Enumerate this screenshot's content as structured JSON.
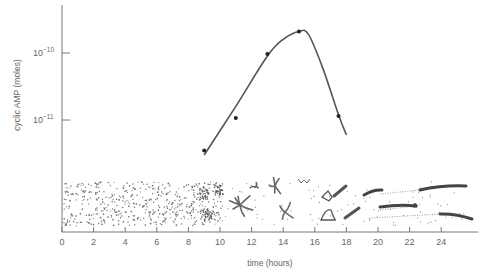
{
  "chart_data": {
    "type": "line",
    "title": "",
    "xlabel": "time (hours)",
    "ylabel": "cyclic AMP (moles)",
    "yscale": "log",
    "x_ticks": [
      0,
      2,
      4,
      6,
      8,
      10,
      12,
      14,
      16,
      18,
      20,
      22,
      24
    ],
    "x_tick_labels": [
      "0",
      "2",
      "4",
      "6",
      "8",
      "10",
      "12",
      "14",
      "16",
      "18",
      "20",
      "22",
      "24"
    ],
    "xlim": [
      0,
      26
    ],
    "y_ticks": [
      1e-10,
      1e-11
    ],
    "y_tick_labels": [
      {
        "base": "10",
        "exp": "−10"
      },
      {
        "base": "10",
        "exp": "−11"
      }
    ],
    "grid": false,
    "legend": null,
    "series": [
      {
        "name": "measured cyclic AMP",
        "marker": "dot",
        "x": [
          9,
          11,
          13,
          15,
          17.5
        ],
        "y": [
          3.5e-12,
          1.07e-11,
          9.7e-11,
          2.1e-10,
          1.15e-11
        ]
      },
      {
        "name": "fitted curve",
        "marker": "none",
        "x": [
          9,
          11,
          13,
          14,
          15,
          15.6,
          16.5,
          17.5,
          18
        ],
        "y": [
          3e-12,
          1.6e-11,
          9e-11,
          1.6e-10,
          2.1e-10,
          1.9e-10,
          6e-11,
          1.2e-11,
          6e-12
        ]
      }
    ],
    "annotations": [
      {
        "type": "illustration-strip",
        "x_range": [
          0,
          26
        ],
        "description": "Dictyostelium development: scattered amoebae (0-9 h), aggregation centers and streams (9-18 h), elongated slugs (18-26 h)"
      }
    ]
  }
}
